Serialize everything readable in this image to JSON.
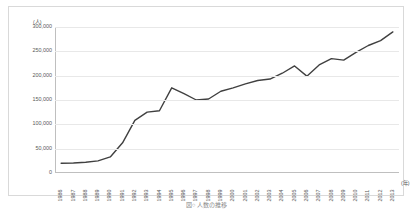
{
  "chart_data": {
    "type": "line",
    "title": "",
    "xlabel": "年",
    "ylabel": "(人)",
    "ylim": [
      0,
      300000
    ],
    "grid": true,
    "legend": "none",
    "y_ticks": [
      0,
      50000,
      100000,
      150000,
      200000,
      250000,
      300000
    ],
    "y_tick_labels": [
      "0",
      "50,000",
      "100,000",
      "150,000",
      "200,000",
      "250,000",
      "300,000"
    ],
    "categories": [
      "1986",
      "1987",
      "1988",
      "1989",
      "1990",
      "1991",
      "1992",
      "1993",
      "1994",
      "1995",
      "1996",
      "1997",
      "1998",
      "1999",
      "2000",
      "2001",
      "2002",
      "2003",
      "2004",
      "2005",
      "2006",
      "2007",
      "2008",
      "2009",
      "2010",
      "2011",
      "2012",
      "2013"
    ],
    "series": [
      {
        "name": "人数",
        "color": "#404040",
        "values": [
          20000,
          20500,
          22000,
          25000,
          33000,
          62000,
          108000,
          125000,
          128000,
          175000,
          163000,
          150000,
          152000,
          168000,
          175000,
          183000,
          190000,
          193000,
          205000,
          220000,
          199000,
          222000,
          235000,
          232000,
          248000,
          262000,
          272000,
          290000
        ]
      }
    ]
  },
  "figure": {
    "caption": "図○ 人数の推移"
  },
  "axes": {
    "y_unit_label": "(人)",
    "x_unit_label": "(年)"
  }
}
